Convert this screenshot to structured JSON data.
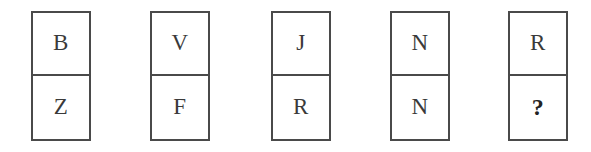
{
  "puzzle": {
    "type": "letter-sequence-domino",
    "background_color": "#ffffff",
    "border_color": "#4a4a4a",
    "text_color": "#3a3a3a",
    "unknown_marker": "?",
    "cards": [
      {
        "top": "B",
        "bottom": "Z"
      },
      {
        "top": "V",
        "bottom": "F"
      },
      {
        "top": "J",
        "bottom": "R"
      },
      {
        "top": "N",
        "bottom": "N"
      },
      {
        "top": "R",
        "bottom": "?"
      }
    ]
  }
}
